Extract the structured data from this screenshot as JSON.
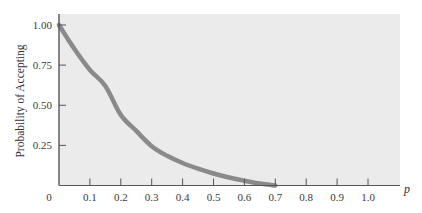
{
  "chart_data": {
    "type": "line",
    "title": "",
    "xlabel": "p",
    "ylabel": "Probability of Accepting",
    "xlim": [
      0,
      1.1
    ],
    "ylim": [
      0,
      1.09
    ],
    "grid": false,
    "legend": null,
    "x_ticks": [
      0.1,
      0.2,
      0.3,
      0.4,
      0.5,
      0.6,
      0.7,
      0.8,
      0.9,
      1.0
    ],
    "x_tick_labels": [
      "0.1",
      "0.2",
      "0.3",
      "0.4",
      "0.5",
      "0.6",
      "0.7",
      "0.8",
      "0.9",
      "1.0"
    ],
    "y_ticks": [
      0.25,
      0.5,
      0.75,
      1.0
    ],
    "y_tick_labels": [
      "0.25",
      "0.50",
      "0.75",
      "1.00"
    ],
    "origin_label": "0",
    "series": [
      {
        "name": "OC curve",
        "color": "#8a8a8a",
        "x": [
          0,
          0.05,
          0.1,
          0.15,
          0.2,
          0.25,
          0.3,
          0.35,
          0.4,
          0.45,
          0.5,
          0.55,
          0.6,
          0.65,
          0.7
        ],
        "y": [
          1.0,
          0.85,
          0.72,
          0.62,
          0.44,
          0.34,
          0.245,
          0.185,
          0.14,
          0.105,
          0.075,
          0.05,
          0.03,
          0.012,
          0.0
        ]
      }
    ],
    "colors": {
      "plot_background": "#ebebeb",
      "axis": "#555555",
      "curve": "#8a8a8a"
    }
  }
}
